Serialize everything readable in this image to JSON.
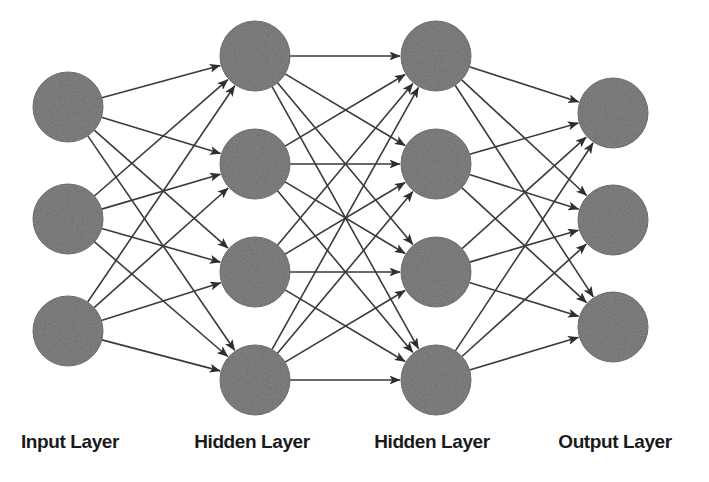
{
  "diagram": {
    "type": "feedforward-neural-network",
    "canvas": {
      "width": 709,
      "height": 482,
      "background": "#ffffff"
    },
    "node_style": {
      "fill": "#6e6e6e",
      "stroke": "#5a5a5a",
      "radius": 35
    },
    "edge_style": {
      "color": "#3a3a3a",
      "width": 1.6,
      "arrowhead": "filled-triangle"
    },
    "layers": [
      {
        "id": "input",
        "label": "Input Layer",
        "label_x": 70,
        "label_y": 432,
        "node_count": 3,
        "x": 68,
        "node_y": [
          107,
          219,
          331
        ]
      },
      {
        "id": "hidden1",
        "label": "Hidden Layer",
        "label_x": 252,
        "label_y": 432,
        "node_count": 4,
        "x": 255,
        "node_y": [
          56,
          164,
          272,
          380
        ]
      },
      {
        "id": "hidden2",
        "label": "Hidden Layer",
        "label_x": 432,
        "label_y": 432,
        "node_count": 4,
        "x": 436,
        "node_y": [
          56,
          164,
          272,
          380
        ]
      },
      {
        "id": "output",
        "label": "Output Layer",
        "label_x": 615,
        "label_y": 432,
        "node_count": 3,
        "x": 613,
        "node_y": [
          113,
          220,
          327
        ]
      }
    ],
    "connections": [
      {
        "from": "input",
        "to": "hidden1",
        "pattern": "fully-connected",
        "edge_count": 12
      },
      {
        "from": "hidden1",
        "to": "hidden2",
        "pattern": "fully-connected",
        "edge_count": 16
      },
      {
        "from": "hidden2",
        "to": "output",
        "pattern": "fully-connected",
        "edge_count": 12
      }
    ]
  }
}
